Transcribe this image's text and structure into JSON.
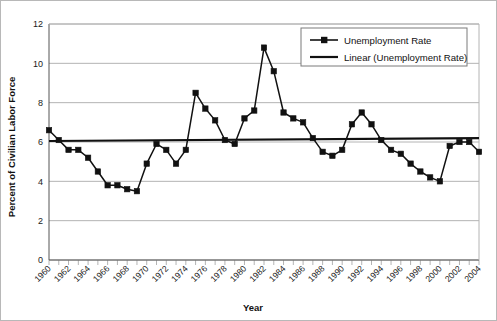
{
  "chart_data": {
    "type": "line",
    "title": "",
    "xlabel": "Year",
    "ylabel": "Percent of Civilian Labor Force",
    "xlim": [
      1960,
      2004
    ],
    "ylim": [
      0,
      12
    ],
    "ytick_step": 2,
    "xtick_step": 2,
    "grid": true,
    "legend_position": "top-right",
    "x": [
      1960,
      1961,
      1962,
      1963,
      1964,
      1965,
      1966,
      1967,
      1968,
      1969,
      1970,
      1971,
      1972,
      1973,
      1974,
      1975,
      1976,
      1977,
      1978,
      1979,
      1980,
      1981,
      1982,
      1983,
      1984,
      1985,
      1986,
      1987,
      1988,
      1989,
      1990,
      1991,
      1992,
      1993,
      1994,
      1995,
      1996,
      1997,
      1998,
      1999,
      2000,
      2001,
      2002,
      2003,
      2004
    ],
    "series": [
      {
        "name": "Unemployment Rate",
        "marker": "square",
        "color": "#111111",
        "values": [
          6.6,
          6.1,
          5.6,
          5.6,
          5.2,
          4.5,
          3.8,
          3.8,
          3.6,
          3.5,
          4.9,
          5.9,
          5.6,
          4.9,
          5.6,
          8.5,
          7.7,
          7.1,
          6.1,
          5.9,
          7.2,
          7.6,
          10.8,
          9.6,
          7.5,
          7.2,
          7.0,
          6.2,
          5.5,
          5.3,
          5.6,
          6.9,
          7.5,
          6.9,
          6.1,
          5.6,
          5.4,
          4.9,
          4.5,
          4.2,
          4.0,
          5.8,
          6.0,
          6.0,
          5.5
        ]
      },
      {
        "name": "Linear (Unemployment Rate)",
        "marker": "none",
        "color": "#111111",
        "trend": true,
        "y_start": 6.05,
        "y_end": 6.2
      }
    ],
    "ytick_labels": [
      "0",
      "2",
      "4",
      "6",
      "8",
      "10",
      "12"
    ],
    "xtick_labels": [
      "1960",
      "1962",
      "1964",
      "1966",
      "1968",
      "1970",
      "1972",
      "1974",
      "1976",
      "1978",
      "1980",
      "1982",
      "1984",
      "1986",
      "1988",
      "1990",
      "1992",
      "1994",
      "1996",
      "1998",
      "2000",
      "2002",
      "2004"
    ]
  },
  "legend": {
    "items": [
      {
        "label": "Unemployment Rate"
      },
      {
        "label": "Linear (Unemployment Rate)"
      }
    ]
  },
  "colors": {
    "series": "#111111",
    "grid": "#b4b4b4",
    "axis": "#555555",
    "background": "#ffffff",
    "border": "#b8b8b8"
  }
}
